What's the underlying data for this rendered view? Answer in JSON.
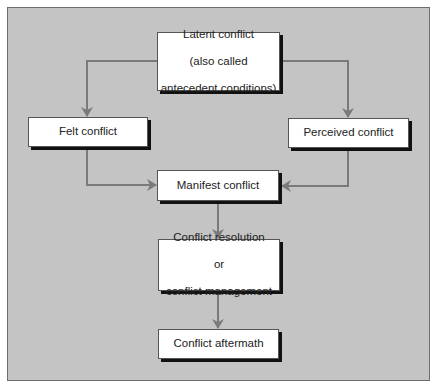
{
  "diagram": {
    "type": "flowchart",
    "colors": {
      "background": "#c4c4c4",
      "box_fill": "#ffffff",
      "box_shadow": "#111111",
      "connector": "#7a7a7a",
      "text": "#222222"
    },
    "nodes": {
      "latent": {
        "line1": "Latent conflict",
        "line2": "(also called",
        "line3": "antecedent conditions)"
      },
      "felt": {
        "label": "Felt conflict"
      },
      "perceived": {
        "label": "Perceived conflict"
      },
      "manifest": {
        "label": "Manifest conflict"
      },
      "resolution": {
        "line1": "Conflict resolution",
        "line2": "or",
        "line3": "conflict management"
      },
      "aftermath": {
        "label": "Conflict aftermath"
      }
    },
    "edges": [
      {
        "from": "latent",
        "to": "felt"
      },
      {
        "from": "latent",
        "to": "perceived"
      },
      {
        "from": "felt",
        "to": "manifest"
      },
      {
        "from": "perceived",
        "to": "manifest"
      },
      {
        "from": "manifest",
        "to": "resolution"
      },
      {
        "from": "resolution",
        "to": "aftermath"
      }
    ]
  }
}
